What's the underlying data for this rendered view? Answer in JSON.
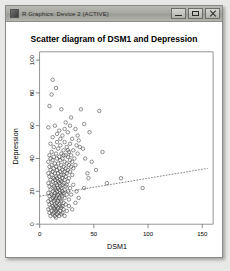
{
  "window": {
    "title": "R Graphics: Device 2 (ACTIVE)",
    "icon": "r-app-icon",
    "buttons": {
      "minimize": "Minimize",
      "maximize": "Maximize",
      "close": "Close"
    }
  },
  "chart_data": {
    "type": "scatter",
    "title": "Scatter diagram of DSM1 and Depression",
    "xlabel": "DSM1",
    "ylabel": "Depression",
    "xlim": [
      0,
      160
    ],
    "ylim": [
      0,
      105
    ],
    "xticks": [
      0,
      50,
      100,
      150
    ],
    "yticks": [
      0,
      20,
      40,
      60,
      80,
      100
    ],
    "grid": false,
    "legend": null,
    "marker": "open-circle",
    "trendline": {
      "style": "dashed",
      "x": [
        0,
        155
      ],
      "y": [
        17,
        34
      ]
    },
    "points": [
      [
        12,
        88
      ],
      [
        15,
        83
      ],
      [
        11,
        79
      ],
      [
        9,
        72
      ],
      [
        20,
        70
      ],
      [
        38,
        70
      ],
      [
        55,
        69
      ],
      [
        29,
        65
      ],
      [
        24,
        62
      ],
      [
        41,
        61
      ],
      [
        14,
        60
      ],
      [
        8,
        59
      ],
      [
        33,
        58
      ],
      [
        18,
        57
      ],
      [
        26,
        56
      ],
      [
        46,
        56
      ],
      [
        21,
        54
      ],
      [
        12,
        53
      ],
      [
        30,
        52
      ],
      [
        36,
        51
      ],
      [
        16,
        50
      ],
      [
        23,
        50
      ],
      [
        10,
        49
      ],
      [
        28,
        49
      ],
      [
        19,
        48
      ],
      [
        34,
        48
      ],
      [
        13,
        47
      ],
      [
        25,
        47
      ],
      [
        40,
        46
      ],
      [
        17,
        46
      ],
      [
        22,
        45
      ],
      [
        31,
        45
      ],
      [
        11,
        44
      ],
      [
        27,
        44
      ],
      [
        15,
        43
      ],
      [
        20,
        43
      ],
      [
        35,
        43
      ],
      [
        9,
        42
      ],
      [
        24,
        42
      ],
      [
        29,
        42
      ],
      [
        13,
        41
      ],
      [
        18,
        41
      ],
      [
        26,
        41
      ],
      [
        32,
        40
      ],
      [
        10,
        40
      ],
      [
        16,
        40
      ],
      [
        21,
        40
      ],
      [
        28,
        39
      ],
      [
        12,
        39
      ],
      [
        19,
        39
      ],
      [
        23,
        38
      ],
      [
        30,
        38
      ],
      [
        8,
        38
      ],
      [
        14,
        37
      ],
      [
        17,
        37
      ],
      [
        25,
        37
      ],
      [
        11,
        36
      ],
      [
        20,
        36
      ],
      [
        27,
        36
      ],
      [
        33,
        36
      ],
      [
        9,
        35
      ],
      [
        15,
        35
      ],
      [
        22,
        35
      ],
      [
        29,
        35
      ],
      [
        13,
        34
      ],
      [
        18,
        34
      ],
      [
        24,
        34
      ],
      [
        31,
        34
      ],
      [
        10,
        33
      ],
      [
        16,
        33
      ],
      [
        21,
        33
      ],
      [
        26,
        33
      ],
      [
        12,
        32
      ],
      [
        19,
        32
      ],
      [
        23,
        32
      ],
      [
        28,
        32
      ],
      [
        8,
        31
      ],
      [
        14,
        31
      ],
      [
        17,
        31
      ],
      [
        25,
        31
      ],
      [
        11,
        30
      ],
      [
        20,
        30
      ],
      [
        22,
        30
      ],
      [
        30,
        30
      ],
      [
        9,
        29
      ],
      [
        15,
        29
      ],
      [
        18,
        29
      ],
      [
        24,
        29
      ],
      [
        13,
        28
      ],
      [
        16,
        28
      ],
      [
        21,
        28
      ],
      [
        27,
        28
      ],
      [
        10,
        27
      ],
      [
        14,
        27
      ],
      [
        19,
        27
      ],
      [
        23,
        27
      ],
      [
        12,
        26
      ],
      [
        17,
        26
      ],
      [
        20,
        26
      ],
      [
        26,
        26
      ],
      [
        8,
        25
      ],
      [
        15,
        25
      ],
      [
        18,
        25
      ],
      [
        22,
        25
      ],
      [
        11,
        24
      ],
      [
        16,
        24
      ],
      [
        21,
        24
      ],
      [
        25,
        24
      ],
      [
        9,
        23
      ],
      [
        13,
        23
      ],
      [
        19,
        23
      ],
      [
        24,
        23
      ],
      [
        14,
        22
      ],
      [
        17,
        22
      ],
      [
        20,
        22
      ],
      [
        28,
        22
      ],
      [
        10,
        21
      ],
      [
        15,
        21
      ],
      [
        18,
        21
      ],
      [
        23,
        21
      ],
      [
        12,
        20
      ],
      [
        16,
        20
      ],
      [
        21,
        20
      ],
      [
        26,
        20
      ],
      [
        8,
        19
      ],
      [
        14,
        19
      ],
      [
        19,
        19
      ],
      [
        22,
        19
      ],
      [
        11,
        18
      ],
      [
        17,
        18
      ],
      [
        20,
        18
      ],
      [
        25,
        18
      ],
      [
        9,
        17
      ],
      [
        13,
        17
      ],
      [
        16,
        17
      ],
      [
        21,
        17
      ],
      [
        12,
        16
      ],
      [
        15,
        16
      ],
      [
        18,
        16
      ],
      [
        23,
        16
      ],
      [
        10,
        15
      ],
      [
        14,
        15
      ],
      [
        19,
        15
      ],
      [
        27,
        15
      ],
      [
        8,
        14
      ],
      [
        13,
        14
      ],
      [
        17,
        14
      ],
      [
        20,
        14
      ],
      [
        11,
        13
      ],
      [
        16,
        13
      ],
      [
        22,
        13
      ],
      [
        45,
        28
      ],
      [
        9,
        12
      ],
      [
        14,
        12
      ],
      [
        18,
        12
      ],
      [
        24,
        12
      ],
      [
        12,
        11
      ],
      [
        15,
        11
      ],
      [
        19,
        11
      ],
      [
        21,
        11
      ],
      [
        10,
        10
      ],
      [
        13,
        10
      ],
      [
        17,
        10
      ],
      [
        20,
        10
      ],
      [
        8,
        9
      ],
      [
        14,
        9
      ],
      [
        16,
        9
      ],
      [
        22,
        9
      ],
      [
        11,
        8
      ],
      [
        15,
        8
      ],
      [
        19,
        8
      ],
      [
        25,
        8
      ],
      [
        9,
        7
      ],
      [
        13,
        7
      ],
      [
        17,
        7
      ],
      [
        21,
        7
      ],
      [
        12,
        6
      ],
      [
        16,
        6
      ],
      [
        20,
        6
      ],
      [
        10,
        5
      ],
      [
        14,
        5
      ],
      [
        18,
        5
      ],
      [
        23,
        5
      ],
      [
        15,
        4
      ],
      [
        62,
        25
      ],
      [
        75,
        28
      ],
      [
        95,
        22
      ],
      [
        52,
        33
      ],
      [
        48,
        38
      ],
      [
        58,
        44
      ],
      [
        37,
        47
      ],
      [
        44,
        31
      ],
      [
        31,
        24
      ],
      [
        34,
        20
      ],
      [
        29,
        18
      ],
      [
        36,
        16
      ],
      [
        41,
        22
      ],
      [
        33,
        13
      ],
      [
        27,
        11
      ],
      [
        30,
        9
      ],
      [
        22,
        42
      ],
      [
        26,
        45
      ],
      [
        19,
        52
      ],
      [
        16,
        55
      ],
      [
        23,
        58
      ],
      [
        28,
        60
      ],
      [
        35,
        54
      ],
      [
        42,
        40
      ]
    ]
  }
}
